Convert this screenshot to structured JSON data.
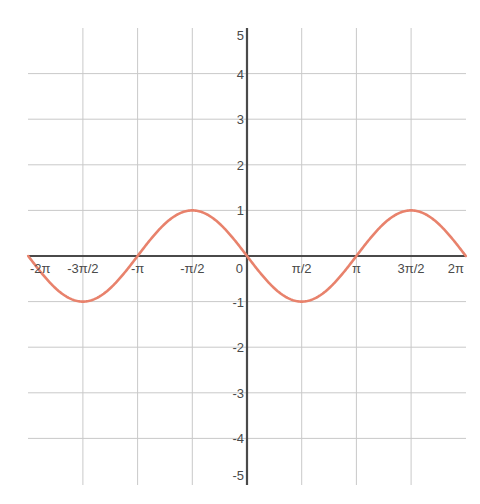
{
  "chart_data": {
    "type": "line",
    "title": "",
    "function": "y = -sin(x)",
    "xlabel": "",
    "ylabel": "",
    "xlim": [
      -6.2832,
      6.2832
    ],
    "ylim": [
      -5,
      5
    ],
    "grid": true,
    "legend": null,
    "x_ticks": [
      {
        "value": -6.2832,
        "label": "-2π"
      },
      {
        "value": -4.7124,
        "label": "-3π/2"
      },
      {
        "value": -3.1416,
        "label": "-π"
      },
      {
        "value": -1.5708,
        "label": "-π/2"
      },
      {
        "value": 0,
        "label": "0"
      },
      {
        "value": 1.5708,
        "label": "π/2"
      },
      {
        "value": 3.1416,
        "label": "π"
      },
      {
        "value": 4.7124,
        "label": "3π/2"
      },
      {
        "value": 6.2832,
        "label": "2π"
      }
    ],
    "y_ticks": [
      {
        "value": 5,
        "label": "5"
      },
      {
        "value": 4,
        "label": "4"
      },
      {
        "value": 3,
        "label": "3"
      },
      {
        "value": 2,
        "label": "2"
      },
      {
        "value": 1,
        "label": "1"
      },
      {
        "value": -1,
        "label": "-1"
      },
      {
        "value": -2,
        "label": "-2"
      },
      {
        "value": -3,
        "label": "-3"
      },
      {
        "value": -4,
        "label": "-4"
      },
      {
        "value": -5,
        "label": "-5"
      }
    ],
    "series": [
      {
        "name": "-sin(x)",
        "color": "#e8826c",
        "x": [
          -6.2832,
          -4.7124,
          -3.1416,
          -1.5708,
          0,
          1.5708,
          3.1416,
          4.7124,
          6.2832
        ],
        "y": [
          0,
          -1,
          0,
          1,
          0,
          -1,
          0,
          1,
          0
        ]
      }
    ]
  },
  "colors": {
    "curve": "#e8826c",
    "grid": "#c9c9c9",
    "axis": "#4a4a4a",
    "background": "#ffffff"
  }
}
